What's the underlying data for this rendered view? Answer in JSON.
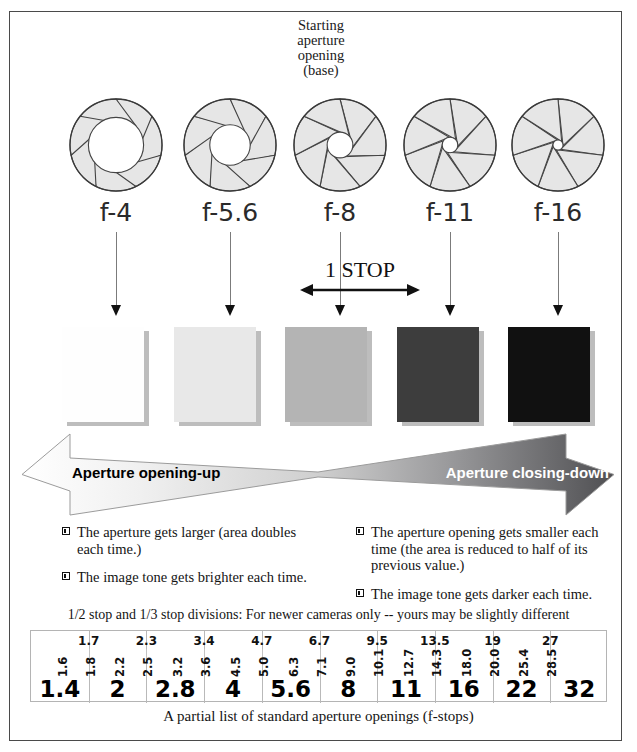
{
  "heading": {
    "lines": [
      "Starting",
      "aperture",
      "opening",
      "(base)"
    ]
  },
  "apertures": [
    {
      "label": "f-4",
      "opening": 0.6,
      "blades": 7
    },
    {
      "label": "f-5.6",
      "opening": 0.44,
      "blades": 7
    },
    {
      "label": "f-8",
      "opening": 0.28,
      "blades": 7
    },
    {
      "label": "f-11",
      "opening": 0.17,
      "blades": 7
    },
    {
      "label": "f-16",
      "opening": 0.11,
      "blades": 7
    }
  ],
  "stop_marker": {
    "label": "1 STOP",
    "from": "f-8",
    "to": "f-11"
  },
  "tones": [
    {
      "for": "f-4",
      "color": "#fefefe"
    },
    {
      "for": "f-5.6",
      "color": "#e8e8e8"
    },
    {
      "for": "f-8",
      "color": "#b4b4b4"
    },
    {
      "for": "f-11",
      "color": "#3d3d3d"
    },
    {
      "for": "f-16",
      "color": "#111111"
    }
  ],
  "bowtie": {
    "left_label": "Aperture opening-up",
    "right_label": "Aperture closing-down",
    "left_color": "#ffffff",
    "right_color": "#58585a"
  },
  "bullets": {
    "left": [
      "The aperture gets larger (area doubles each time.)",
      "The image tone gets brighter each time."
    ],
    "right": [
      "The aperture opening gets smaller each time (the area is reduced to half of its previous value.)",
      "The image tone gets darker each time."
    ]
  },
  "scale": {
    "note": "1/2 stop and 1/3 stop divisions: For newer cameras only -- yours may be slightly different",
    "caption": "A partial list of standard aperture openings (f-stops)",
    "whole_stops": [
      "1.4",
      "2",
      "2.8",
      "4",
      "5.6",
      "8",
      "11",
      "16",
      "22",
      "32"
    ],
    "half_stops": [
      "1.7",
      "2.3",
      "3.4",
      "4.7",
      "6.7",
      "9.5",
      "13.5",
      "19",
      "27"
    ],
    "third_stops": [
      [
        "1.6",
        "1.8"
      ],
      [
        "2.2",
        "2.5"
      ],
      [
        "3.2",
        "3.6"
      ],
      [
        "4.5",
        "5.0"
      ],
      [
        "6.3",
        "7.1"
      ],
      [
        "9.0",
        "10.1"
      ],
      [
        "12.7",
        "14.3"
      ],
      [
        "18.0",
        "20.0"
      ],
      [
        "25.4",
        "28.5"
      ]
    ]
  },
  "chart_data": {
    "type": "table",
    "title": "A partial list of standard aperture openings (f-stops)",
    "subtitle": "1/2 stop and 1/3 stop divisions: For newer cameras only -- yours may be slightly different",
    "rows": [
      {
        "name": "whole stops",
        "values": [
          "1.4",
          "2",
          "2.8",
          "4",
          "5.6",
          "8",
          "11",
          "16",
          "22",
          "32"
        ]
      },
      {
        "name": "1/2 stops",
        "values": [
          "1.7",
          "2.3",
          "3.4",
          "4.7",
          "6.7",
          "9.5",
          "13.5",
          "19",
          "27"
        ]
      },
      {
        "name": "1/3 stops",
        "values": [
          "1.6",
          "1.8",
          "2.2",
          "2.5",
          "3.2",
          "3.6",
          "4.5",
          "5.0",
          "6.3",
          "7.1",
          "9.0",
          "10.1",
          "12.7",
          "14.3",
          "18.0",
          "20.0",
          "25.4",
          "28.5"
        ]
      }
    ],
    "illustrated_stops": [
      "f-4",
      "f-5.6",
      "f-8",
      "f-11",
      "f-16"
    ],
    "tone_values": [
      "#fefefe",
      "#e8e8e8",
      "#b4b4b4",
      "#3d3d3d",
      "#111111"
    ]
  }
}
